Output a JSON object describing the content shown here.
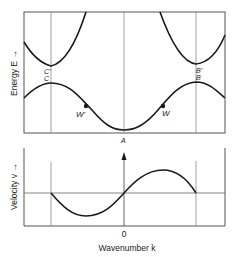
{
  "diagram": {
    "type": "band-structure",
    "panels": [
      {
        "name": "energy",
        "ylabel": "Energy E →",
        "curves": [
          "upper band",
          "lower band"
        ],
        "points": [
          {
            "id": "A",
            "label": "A"
          },
          {
            "id": "W",
            "label": "W"
          },
          {
            "id": "W_prime",
            "label": "W'"
          },
          {
            "id": "B",
            "label": "B"
          },
          {
            "id": "C",
            "label": "C"
          },
          {
            "id": "B_prime",
            "label": "B'"
          },
          {
            "id": "C_prime",
            "label": "C'"
          }
        ]
      },
      {
        "name": "velocity",
        "ylabel": "Velocity v →"
      }
    ],
    "xlabel": "Wavenumber k",
    "xtick_zero": "0"
  },
  "colors": {
    "curve": "#1a1a1a",
    "frame": "#555555",
    "guide": "#888888",
    "background": "#ffffff"
  }
}
